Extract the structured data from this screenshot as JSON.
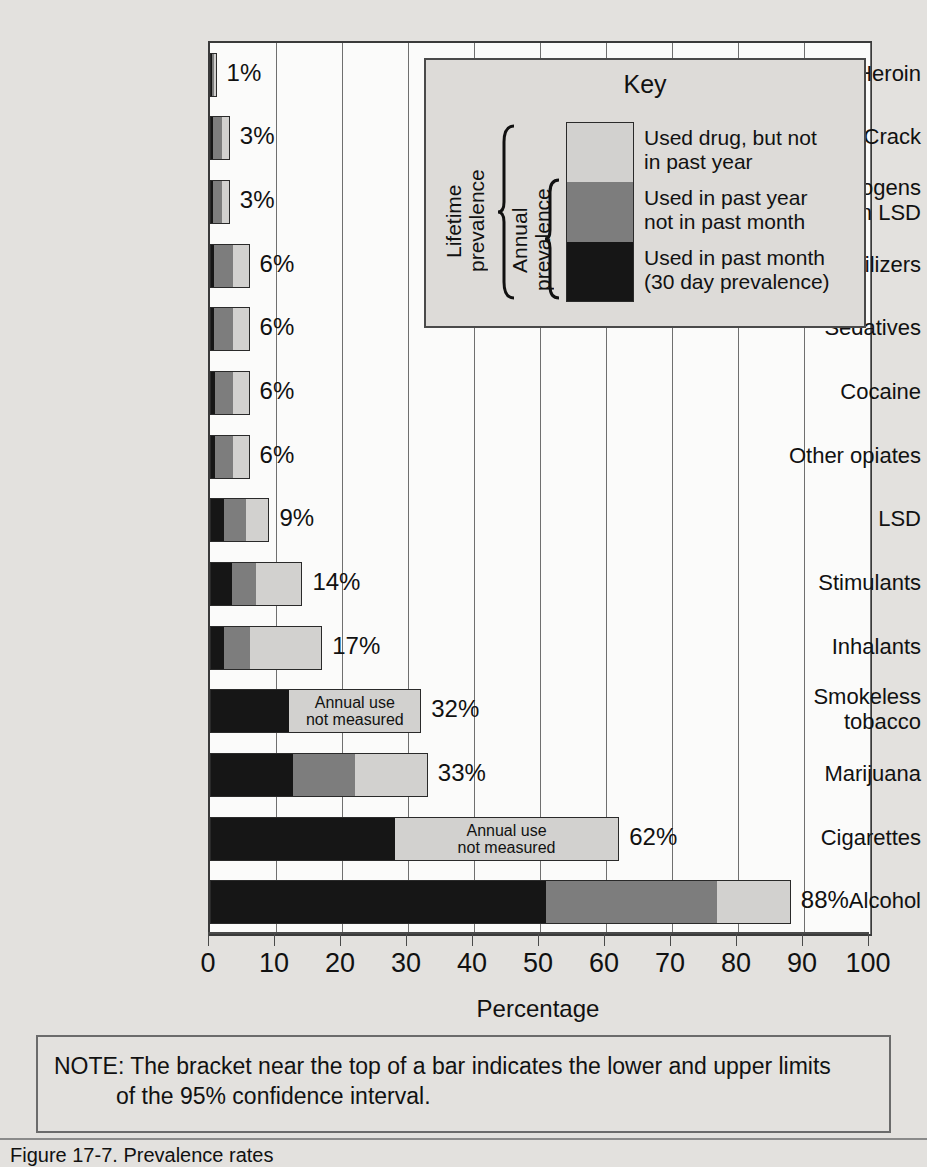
{
  "chart_data": {
    "type": "bar",
    "orientation": "horizontal",
    "stacked": true,
    "title": "",
    "xlabel": "Percentage",
    "ylabel": "",
    "xlim": [
      0,
      100
    ],
    "xticks": [
      0,
      10,
      20,
      30,
      40,
      50,
      60,
      70,
      80,
      90,
      100
    ],
    "grid": "vertical",
    "legend_position": "inside-top-right",
    "series": [
      {
        "name": "Used in past month (30 day prevalence)",
        "key": "month",
        "color": "#161616"
      },
      {
        "name": "Used in past year not in past month",
        "key": "year",
        "color": "#7d7d7d"
      },
      {
        "name": "Used drug, but not in past year",
        "key": "life",
        "color": "#d2d1cf"
      }
    ],
    "categories": [
      "Heroin",
      "Crack",
      "Hallucinogens\nother than LSD",
      "Tranquilizers",
      "Sedatives",
      "Cocaine",
      "Other opiates",
      "LSD",
      "Stimulants",
      "Inhalants",
      "Smokeless\ntobacco",
      "Marijuana",
      "Cigarettes",
      "Alcohol"
    ],
    "rows": [
      {
        "label": "Heroin",
        "month": 0.3,
        "year": 0.4,
        "life": 0.3,
        "total": 1,
        "total_label": "1%",
        "annual_measured": true
      },
      {
        "label": "Crack",
        "month": 0.3,
        "year": 1.5,
        "life": 1.2,
        "total": 3,
        "total_label": "3%",
        "annual_measured": true
      },
      {
        "label": "Hallucinogens other than LSD",
        "month": 0.3,
        "year": 1.5,
        "life": 1.2,
        "total": 3,
        "total_label": "3%",
        "annual_measured": true
      },
      {
        "label": "Tranquilizers",
        "month": 0.5,
        "year": 3.0,
        "life": 2.5,
        "total": 6,
        "total_label": "6%",
        "annual_measured": true
      },
      {
        "label": "Sedatives",
        "month": 0.5,
        "year": 3.0,
        "life": 2.5,
        "total": 6,
        "total_label": "6%",
        "annual_measured": true
      },
      {
        "label": "Cocaine",
        "month": 0.6,
        "year": 2.9,
        "life": 2.5,
        "total": 6,
        "total_label": "6%",
        "annual_measured": true
      },
      {
        "label": "Other opiates",
        "month": 0.6,
        "year": 2.9,
        "life": 2.5,
        "total": 6,
        "total_label": "6%",
        "annual_measured": true
      },
      {
        "label": "LSD",
        "month": 2.0,
        "year": 3.5,
        "life": 3.5,
        "total": 9,
        "total_label": "9%",
        "annual_measured": true
      },
      {
        "label": "Stimulants",
        "month": 3.3,
        "year": 3.7,
        "life": 7.0,
        "total": 14,
        "total_label": "14%",
        "annual_measured": true
      },
      {
        "label": "Inhalants",
        "month": 2.0,
        "year": 4.0,
        "life": 11.0,
        "total": 17,
        "total_label": "17%",
        "annual_measured": true
      },
      {
        "label": "Smokeless tobacco",
        "month": 12.0,
        "year": 0,
        "life": 20.0,
        "total": 32,
        "total_label": "32%",
        "annual_measured": false
      },
      {
        "label": "Marijuana",
        "month": 12.5,
        "year": 9.5,
        "life": 11.0,
        "total": 33,
        "total_label": "33%",
        "annual_measured": true
      },
      {
        "label": "Cigarettes",
        "month": 28.0,
        "year": 0,
        "life": 34.0,
        "total": 62,
        "total_label": "62%",
        "annual_measured": false
      },
      {
        "label": "Alcohol",
        "month": 51.0,
        "year": 26.0,
        "life": 11.0,
        "total": 88,
        "total_label": "88%",
        "annual_measured": true
      }
    ],
    "not_measured_label": "Annual use\nnot measured"
  },
  "key": {
    "title": "Key",
    "swatches": [
      {
        "name": "life-swatch",
        "text": "Used drug, but not\nin past year"
      },
      {
        "name": "year-swatch",
        "text": "Used in past year\nnot in past month"
      },
      {
        "name": "month-swatch",
        "text": "Used in past month\n(30 day prevalence)"
      }
    ],
    "lifetime_bracket_label": "Lifetime\nprevalence",
    "annual_bracket_label": "Annual\nprevalence"
  },
  "axis": {
    "xlabel": "Percentage",
    "ticks": [
      "0",
      "10",
      "20",
      "30",
      "40",
      "50",
      "60",
      "70",
      "80",
      "90",
      "100"
    ]
  },
  "note": {
    "line1": "NOTE: The bracket near the top of a bar indicates the lower and upper limits",
    "line2": "of the 95% confidence interval."
  },
  "caption": "Figure 17-7.  Prevalence rates",
  "colors": {
    "past_month": "#161616",
    "past_year": "#7d7d7d",
    "lifetime": "#d2d1cf",
    "background": "#e3e1de",
    "plot_background": "#fbfbfa",
    "gridline": "#6f6f6f"
  }
}
